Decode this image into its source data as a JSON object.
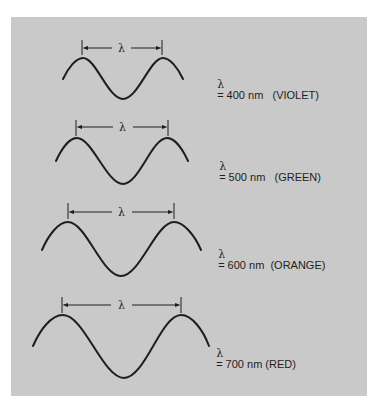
{
  "diagram": {
    "background_color": "#c9c9c9",
    "stroke_color": "#1e1e1e",
    "waves": [
      {
        "symbol": "λ",
        "label": "= 400 nm   (VIOLET)",
        "wavelength_nm": 400,
        "color_name": "VIOLET"
      },
      {
        "symbol": "λ",
        "label": "= 500 nm   (GREEN)",
        "wavelength_nm": 500,
        "color_name": "GREEN"
      },
      {
        "symbol": "λ",
        "label": "= 600 nm  (ORANGE)",
        "wavelength_nm": 600,
        "color_name": "ORANGE"
      },
      {
        "symbol": "λ",
        "label": "= 700 nm (RED)",
        "wavelength_nm": 700,
        "color_name": "RED"
      }
    ]
  }
}
